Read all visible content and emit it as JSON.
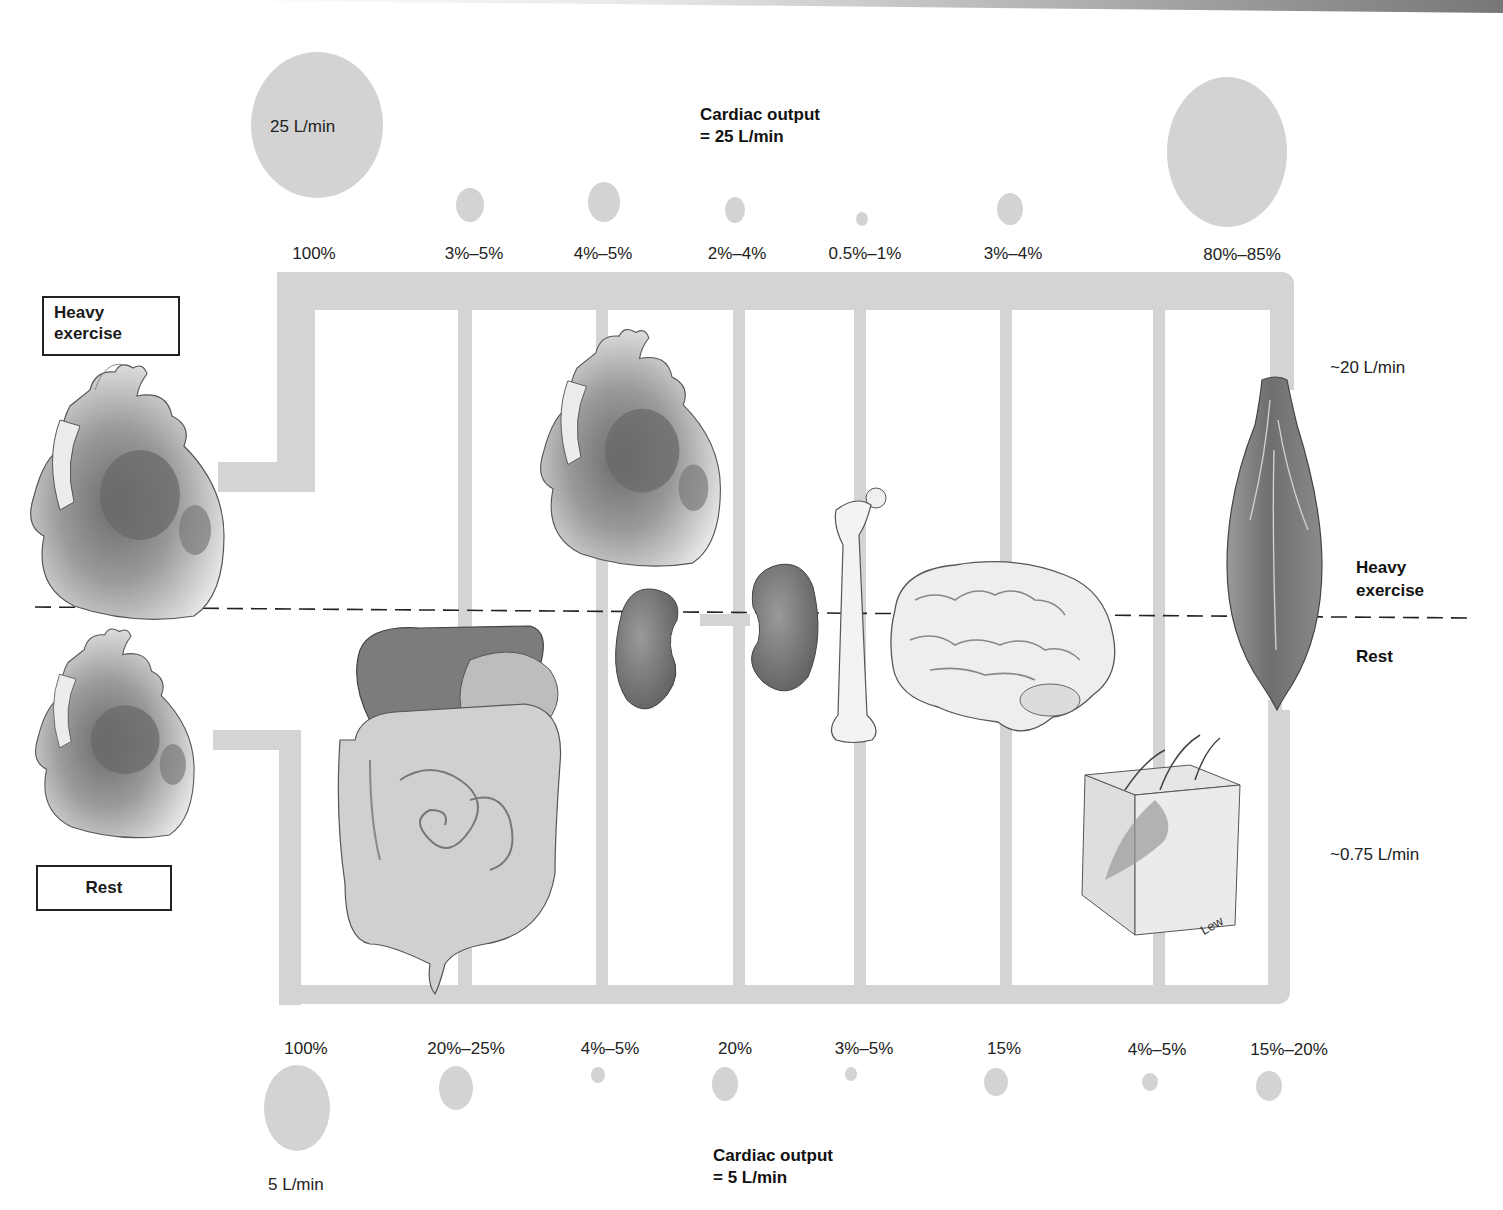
{
  "exercise": {
    "state_label_box": "Heavy\nexercise",
    "state_label_box_line1": "Heavy",
    "state_label_box_line2": "exercise",
    "cardiac_output_title": "Cardiac output",
    "cardiac_output_value": "= 25 L/min",
    "total_circle_label": "25 L/min",
    "muscle_flow_label": "~20 L/min",
    "distribution": [
      {
        "organ": "heart-total",
        "percent": "100%"
      },
      {
        "organ": "digestive",
        "percent": "3%–5%"
      },
      {
        "organ": "heart",
        "percent": "4%–5%"
      },
      {
        "organ": "kidneys",
        "percent": "2%–4%"
      },
      {
        "organ": "bone",
        "percent": "0.5%–1%"
      },
      {
        "organ": "brain",
        "percent": "3%–4%"
      },
      {
        "organ": "muscle",
        "percent": "80%–85%"
      }
    ]
  },
  "rest": {
    "state_label_box": "Rest",
    "cardiac_output_title": "Cardiac output",
    "cardiac_output_value": "= 5 L/min",
    "total_circle_label": "5 L/min",
    "skin_flow_label": "~0.75 L/min",
    "distribution": [
      {
        "organ": "heart-total",
        "percent": "100%"
      },
      {
        "organ": "digestive",
        "percent": "20%–25%"
      },
      {
        "organ": "heart",
        "percent": "4%–5%"
      },
      {
        "organ": "kidneys",
        "percent": "20%"
      },
      {
        "organ": "bone",
        "percent": "3%–5%"
      },
      {
        "organ": "brain",
        "percent": "15%"
      },
      {
        "organ": "skin",
        "percent": "4%–5%"
      },
      {
        "organ": "muscle",
        "percent": "15%–20%"
      }
    ]
  },
  "divider": {
    "upper_label_line1": "Heavy",
    "upper_label_line2": "exercise",
    "lower_label": "Rest"
  },
  "signature": "Lew",
  "colors": {
    "pipe": "#d4d4d4",
    "circle": "#d3d3d3",
    "organ_dark": "#6e6e6e",
    "organ_light": "#e6e6e6",
    "text": "#1a1a1a"
  }
}
